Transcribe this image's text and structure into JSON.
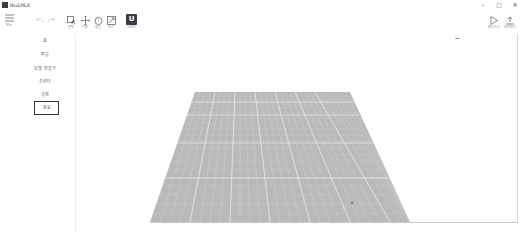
{
  "window": {
    "title": "IkuLHLX",
    "controls": {
      "minimize": "–",
      "maximize": "□",
      "close": "✕"
    }
  },
  "toolbar": {
    "menu": {
      "icon": "hamburger-icon",
      "label": "메뉴"
    },
    "undo": {
      "icon": "undo-icon"
    },
    "redo": {
      "icon": "redo-icon"
    },
    "tools": [
      {
        "icon": "select-icon",
        "label": "선택"
      },
      {
        "icon": "move-icon",
        "label": "이동"
      },
      {
        "icon": "rotate-icon",
        "label": "회전"
      },
      {
        "icon": "scale-icon",
        "label": "크기"
      },
      {
        "icon": "support-icon",
        "label": "서포트",
        "glyph": "U"
      }
    ],
    "right": [
      {
        "icon": "play-icon",
        "label": "슬라이스"
      },
      {
        "icon": "export-icon",
        "label": "내보내기"
      }
    ]
  },
  "sidebar": {
    "items": [
      {
        "label": "홈"
      },
      {
        "label": "파일"
      },
      {
        "label": "모델 만들기"
      },
      {
        "label": "프린터"
      },
      {
        "label": "설정"
      },
      {
        "label": "종료",
        "boxed": true
      }
    ]
  },
  "viewport": {
    "view_label": "••",
    "plate": {
      "color": "#b8b8b8",
      "grid_color": "#e2e2e2",
      "top_left": [
        195,
        92
      ],
      "top_right": [
        350,
        92
      ],
      "bottom_right": [
        410,
        222
      ],
      "bottom_left": [
        150,
        222
      ]
    }
  }
}
